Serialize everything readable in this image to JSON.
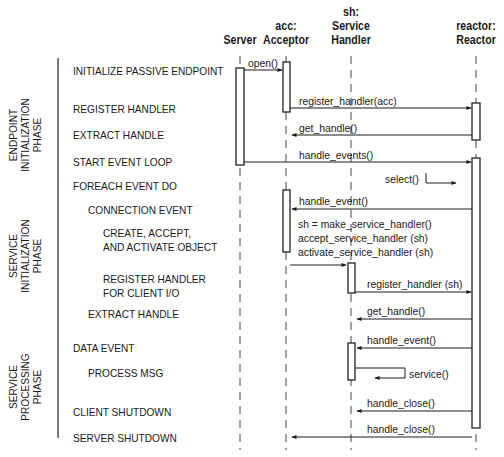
{
  "diagram": {
    "type": "sequence-diagram",
    "participants": [
      {
        "id": "server",
        "line1": "",
        "line2": "",
        "line3": "Server"
      },
      {
        "id": "acceptor",
        "line1": "",
        "line2": "acc:",
        "line3": "Acceptor"
      },
      {
        "id": "service_handler",
        "line1": "sh:",
        "line2": "Service",
        "line3": "Handler"
      },
      {
        "id": "reactor",
        "line1": "",
        "line2": "reactor:",
        "line3": "Reactor"
      }
    ],
    "phases": [
      {
        "line1": "ENDPOINT",
        "line2": "INITIALIZATION",
        "line3": "PHASE"
      },
      {
        "line1": "SERVICE",
        "line2": "INITIALIZATION",
        "line3": "PHASE"
      },
      {
        "line1": "SERVICE",
        "line2": "PROCESSING",
        "line3": "PHASE"
      }
    ],
    "steps": [
      {
        "label": "INITIALIZE PASSIVE ENDPOINT"
      },
      {
        "label": "REGISTER HANDLER"
      },
      {
        "label": "EXTRACT HANDLE"
      },
      {
        "label": "START EVENT LOOP"
      },
      {
        "label": "FOREACH EVENT DO"
      },
      {
        "label": "CONNECTION EVENT"
      },
      {
        "line1": "CREATE, ACCEPT,",
        "line2": "AND ACTIVATE OBJECT"
      },
      {
        "line1": "REGISTER HANDLER",
        "line2": "FOR CLIENT I/O"
      },
      {
        "label": "EXTRACT HANDLE"
      },
      {
        "label": "DATA EVENT"
      },
      {
        "label": "PROCESS MSG"
      },
      {
        "label": "CLIENT SHUTDOWN"
      },
      {
        "label": "SERVER SHUTDOWN"
      }
    ],
    "messages": [
      {
        "label": "open()",
        "from": "Server",
        "to": "Acceptor"
      },
      {
        "label": "register_handler(acc)",
        "from": "Acceptor",
        "to": "Reactor"
      },
      {
        "label": "get_handle()",
        "from": "Reactor",
        "to": "Acceptor"
      },
      {
        "label": "handle_events()",
        "from": "Server",
        "to": "Reactor"
      },
      {
        "label": "select()",
        "from": "Reactor",
        "to": "Reactor"
      },
      {
        "label": "handle_event()",
        "from": "Reactor",
        "to": "Acceptor"
      },
      {
        "line1": "sh = make_service_handler()",
        "line2": "accept_service_handler (sh)",
        "line3": "activate_service_handler (sh)",
        "from": "Acceptor",
        "to": "Service Handler"
      },
      {
        "label": "register_handler (sh)",
        "from": "Service Handler",
        "to": "Reactor"
      },
      {
        "label": "get_handle()",
        "from": "Reactor",
        "to": "Service Handler"
      },
      {
        "label": "handle_event()",
        "from": "Reactor",
        "to": "Service Handler"
      },
      {
        "label": "service()",
        "from": "Service Handler",
        "to": "Service Handler"
      },
      {
        "label": "handle_close()",
        "from": "Reactor",
        "to": "Service Handler"
      },
      {
        "label": "handle_close()",
        "from": "Reactor",
        "to": "Acceptor"
      }
    ]
  }
}
